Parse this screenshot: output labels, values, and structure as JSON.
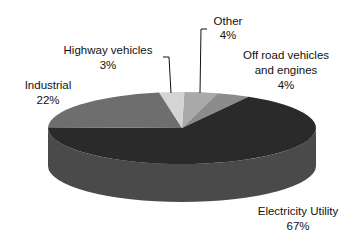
{
  "chart_data": {
    "type": "pie",
    "style": "3d",
    "title": "",
    "slices": [
      {
        "label": "Other",
        "value": 4,
        "pct_label": "4%",
        "color": "#a9a9a9"
      },
      {
        "label": "Off road vehicles and engines",
        "value": 4,
        "pct_label": "4%",
        "color": "#8c8c8c"
      },
      {
        "label": "Electricity Utility",
        "value": 67,
        "pct_label": "67%",
        "color": "#2a2a2a"
      },
      {
        "label": "Industrial",
        "value": 22,
        "pct_label": "22%",
        "color": "#6e6e6e"
      },
      {
        "label": "Highway vehicles",
        "value": 3,
        "pct_label": "3%",
        "color": "#d4d4d4"
      }
    ],
    "side_color": "#4a4a4a",
    "labels": {
      "other": [
        "Other",
        "4%"
      ],
      "offroad": [
        "Off road vehicles",
        "and engines",
        "4%"
      ],
      "electricity": [
        "Electricity Utility",
        "67%"
      ],
      "industrial": [
        "Industrial",
        "22%"
      ],
      "highway": [
        "Highway vehicles",
        "3%"
      ]
    }
  }
}
